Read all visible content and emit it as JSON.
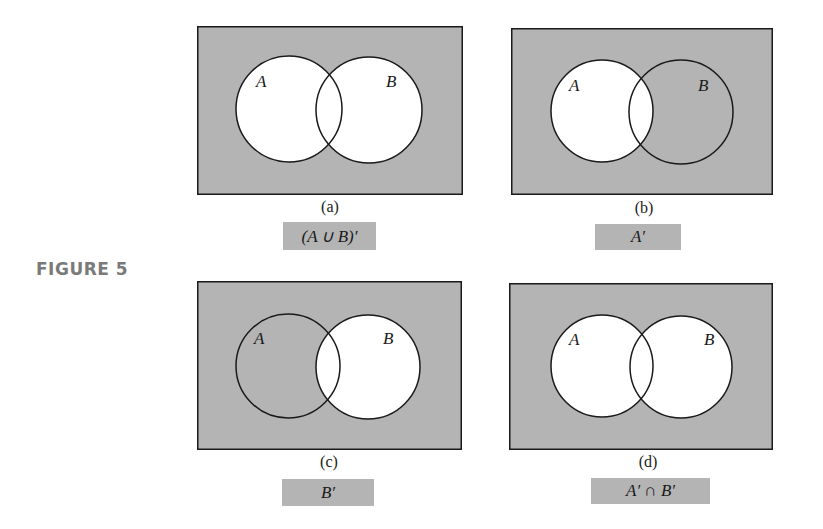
{
  "figure": {
    "label": "FIGURE 5",
    "shade_color": "#b4b4b4",
    "stroke_color": "#1a1a1a",
    "panels": [
      {
        "id": "a",
        "sub_label": "(a)",
        "caption": "(A ∪ B)′",
        "set_a_label": "A",
        "set_b_label": "B",
        "shaded_region": "outside both A and B"
      },
      {
        "id": "b",
        "sub_label": "(b)",
        "caption": "A′",
        "set_a_label": "A",
        "set_b_label": "B",
        "shaded_region": "outside A (includes B only)"
      },
      {
        "id": "c",
        "sub_label": "(c)",
        "caption": "B′",
        "set_a_label": "A",
        "set_b_label": "B",
        "shaded_region": "outside B (includes A only)"
      },
      {
        "id": "d",
        "sub_label": "(d)",
        "caption": "A′ ∩ B′",
        "set_a_label": "A",
        "set_b_label": "B",
        "shaded_region": "outside both A and B"
      }
    ]
  }
}
